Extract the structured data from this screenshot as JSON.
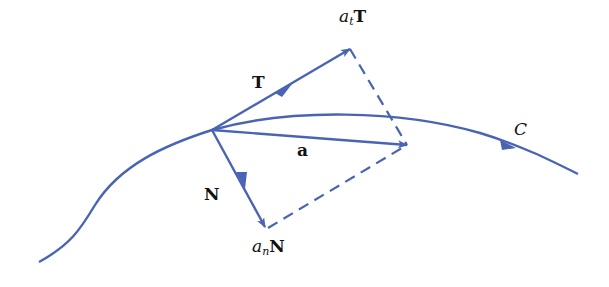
{
  "diagram": {
    "colors": {
      "stroke": "#4a64b4",
      "text": "#111111",
      "background": "#ffffff"
    },
    "labels": {
      "tangent": "T",
      "tangential_component": {
        "coef": "a",
        "sub": "t",
        "vec": "T"
      },
      "acceleration": "a",
      "normal": "N",
      "normal_component": {
        "coef": "a",
        "sub": "n",
        "vec": "N"
      },
      "curve": "C"
    }
  }
}
